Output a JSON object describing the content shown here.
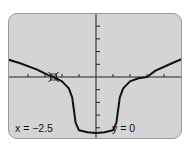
{
  "screen": {
    "background": "#d4d4d4",
    "curve_color": "#111111"
  },
  "chart_data": {
    "type": "line",
    "title": "",
    "xlim": [
      -5.5,
      5.2
    ],
    "ylim": [
      -5.0,
      4.0
    ],
    "x_ticks": [
      -4,
      -3,
      -2,
      -1,
      1,
      2,
      3,
      4
    ],
    "y_ticks": [
      -4,
      -3,
      -2,
      -1,
      1,
      2,
      3,
      4
    ],
    "series": [
      {
        "name": "graph",
        "x": [
          -5.5,
          -4.5,
          -3.5,
          -2.8,
          -2.5,
          -2.0,
          -1.6,
          -1.4,
          -1.3,
          -1.2,
          -1.0,
          -0.5,
          0,
          0.5,
          1.0,
          1.2,
          1.3,
          1.4,
          1.6,
          2.0,
          2.5,
          3.0,
          3.5,
          4.5,
          5.2
        ],
        "y": [
          1.5,
          1.1,
          0.6,
          0.15,
          0,
          -0.35,
          -0.9,
          -1.6,
          -2.6,
          -3.6,
          -4.2,
          -4.35,
          -4.4,
          -4.35,
          -4.2,
          -3.6,
          -2.6,
          -1.6,
          -0.9,
          -0.35,
          -0.1,
          0,
          0.5,
          1.1,
          1.5
        ]
      }
    ],
    "cursor": {
      "x": -2.5,
      "y": 0
    }
  },
  "readout": {
    "x_label": "x = −2.5",
    "y_label": "y = 0"
  }
}
